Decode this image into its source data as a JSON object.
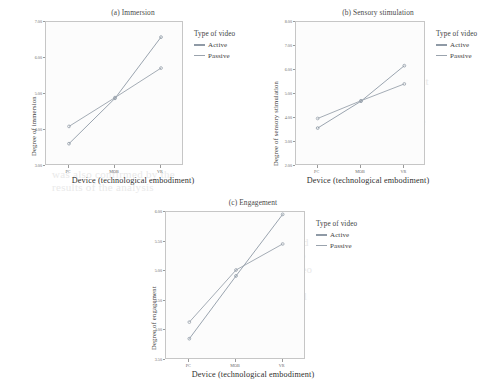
{
  "figure": {
    "legend_title": "Type of video",
    "series_names": [
      "Active",
      "Passive"
    ],
    "colors": {
      "active": "#8f9aa6",
      "passive": "#9aa3ad",
      "axis": "#9a9a9a",
      "plot_bg": "#fcfcfc",
      "frame": "#c6c6c6"
    },
    "xlabel": "Device (technological embodiment)",
    "xticks": [
      "PC",
      "MOB",
      "VR"
    ]
  },
  "bleed_text": {
    "a": "the second hypothesis that the\nuse of more immersive devices\nleads to a greater degree of\nimmersion, sensory stimulation\nand engagement in the viewer\nwas also confirmed by the\nresults of the analysis",
    "b": "the interaction effect between\nthe type of video and the\ndevice used was significant\nfor all three of the dependent\nvariables considered in the\nstudy, as can be seen in",
    "c": "a greater degree of\nimmersion was reported\nby the participants who\nwatched the active video\non the virtual reality\nheadset compared to all\nother conditions tested"
  },
  "chart_data": [
    {
      "type": "line",
      "panel": "a",
      "title": "(a) Immersion",
      "xlabel": "Device (technological embodiment)",
      "ylabel": "Degree of immersion",
      "categories": [
        "PC",
        "MOB",
        "VR"
      ],
      "yticks": [
        "3.00",
        "4.00",
        "5.00",
        "6.00",
        "7.00"
      ],
      "ylim": [
        3.0,
        7.0
      ],
      "grid": false,
      "legend_position": "right",
      "series": [
        {
          "name": "Active",
          "values": [
            3.62,
            4.88,
            6.58
          ]
        },
        {
          "name": "Passive",
          "values": [
            4.1,
            4.9,
            5.72
          ]
        }
      ]
    },
    {
      "type": "line",
      "panel": "b",
      "title": "(b) Sensory stimulation",
      "xlabel": "Device (technological embodiment)",
      "ylabel": "Degree of sensory stimulation",
      "categories": [
        "PC",
        "MOB",
        "VR"
      ],
      "yticks": [
        "2.00",
        "3.00",
        "4.00",
        "5.00",
        "6.00",
        "7.00",
        "8.00"
      ],
      "ylim": [
        2.0,
        8.0
      ],
      "grid": false,
      "legend_position": "right",
      "series": [
        {
          "name": "Active",
          "values": [
            3.58,
            4.7,
            6.18
          ]
        },
        {
          "name": "Passive",
          "values": [
            3.98,
            4.72,
            5.42
          ]
        }
      ]
    },
    {
      "type": "line",
      "panel": "c",
      "title": "(c) Engagement",
      "xlabel": "Device (technological embodiment)",
      "ylabel": "Degree of engagement",
      "categories": [
        "PC",
        "MOB",
        "VR"
      ],
      "yticks": [
        "3.50",
        "4.00",
        "4.50",
        "5.00",
        "5.50",
        "6.00"
      ],
      "ylim": [
        3.5,
        6.0
      ],
      "grid": false,
      "legend_position": "right",
      "series": [
        {
          "name": "Active",
          "values": [
            3.86,
            4.92,
            5.96
          ]
        },
        {
          "name": "Passive",
          "values": [
            4.14,
            5.02,
            5.46
          ]
        }
      ]
    }
  ]
}
